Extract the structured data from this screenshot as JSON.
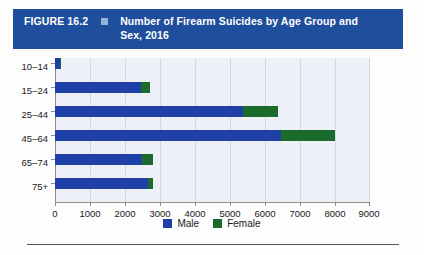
{
  "header": {
    "figure_label": "FIGURE 16.2",
    "marker_icon": "square-glyph",
    "title": "Number of Firearm Suicides by Age Group and Sex, 2016",
    "bar_color": "#1F4E9C",
    "marker_color": "#8FB3DD",
    "text_color": "#FFFFFF"
  },
  "chart_data": {
    "type": "bar",
    "orientation": "horizontal",
    "stacked": true,
    "title": "Number of Firearm Suicides by Age Group and Sex, 2016",
    "xlabel": "",
    "ylabel": "",
    "categories": [
      "10–14",
      "15–24",
      "25–44",
      "45–64",
      "65–74",
      "75+"
    ],
    "series": [
      {
        "name": "Male",
        "color": "#1F3FA8",
        "values": [
          130,
          2450,
          5370,
          6480,
          2500,
          2650
        ]
      },
      {
        "name": "Female",
        "color": "#1B6B2C",
        "values": [
          40,
          270,
          1010,
          1520,
          300,
          160
        ]
      }
    ],
    "totals": [
      170,
      2720,
      6380,
      8000,
      2800,
      2810
    ],
    "xlim": [
      0,
      9000
    ],
    "xticks": [
      0,
      1000,
      2000,
      3000,
      4000,
      5000,
      6000,
      7000,
      8000,
      9000
    ],
    "xtick_labels": [
      "0",
      "1000",
      "2000",
      "3000",
      "4000",
      "5000",
      "6000",
      "7000",
      "8000",
      "9000"
    ],
    "grid": true,
    "grid_axis": "x",
    "legend_position": "bottom-center",
    "plot_background": "#EDF0F7"
  },
  "legend": {
    "items": [
      {
        "label": "Male",
        "color": "#1F3FA8"
      },
      {
        "label": "Female",
        "color": "#1B6B2C"
      }
    ]
  }
}
